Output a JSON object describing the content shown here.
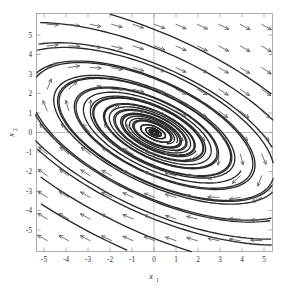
{
  "figure": {
    "kind": "phase-portrait",
    "background_color": "#ffffff",
    "frame_color": "#9a9a9a",
    "trajectory_color": "#2a2a2a",
    "arrow_color": "#585858"
  },
  "axes": {
    "x_title": "x",
    "x_subscript": "1",
    "y_title": "x",
    "y_subscript": "2",
    "x_ticks": [
      "-5",
      "-4",
      "-3",
      "-2",
      "-1",
      "0",
      "1",
      "2",
      "3",
      "4",
      "5"
    ],
    "y_ticks": [
      "5",
      "4",
      "3",
      "2",
      "1",
      "0",
      "-1",
      "-2",
      "-3",
      "-4",
      "-5"
    ],
    "x_range": [
      -5.5,
      5.5
    ],
    "y_range": [
      -5.5,
      5.5
    ]
  },
  "chart_data": {
    "type": "line",
    "title": "",
    "subtitle": "",
    "xlabel": "x1",
    "ylabel": "x2",
    "xlim": [
      -5.5,
      5.5
    ],
    "ylim": [
      -5.5,
      5.5
    ],
    "xticks": [
      -5,
      -4,
      -3,
      -2,
      -1,
      0,
      1,
      2,
      3,
      4,
      5
    ],
    "yticks": [
      -5,
      -4,
      -3,
      -2,
      -1,
      0,
      1,
      2,
      3,
      4,
      5
    ],
    "grid": false,
    "legend": "none",
    "equilibrium": {
      "x": 0,
      "y": 0,
      "classification": "stable spiral (focus)",
      "rotation": "clockwise"
    },
    "spiral_model": {
      "r0_values": [
        0.28,
        0.52,
        0.85,
        1.35,
        2.1,
        3.1,
        4.4,
        6.0,
        7.8,
        9.8,
        12.0,
        14.6
      ],
      "decay_rate": 0.072,
      "angular_rate": 1.0,
      "ellipse_axis_ratio": 0.42,
      "ellipse_tilt_degrees": -24,
      "theta_span_turns": 2.6
    },
    "series": [
      {
        "name": "trajectory-1",
        "r0": 0.28,
        "comment": "innermost tight spiral"
      },
      {
        "name": "trajectory-2",
        "r0": 0.52
      },
      {
        "name": "trajectory-3",
        "r0": 0.85
      },
      {
        "name": "trajectory-4",
        "r0": 1.35
      },
      {
        "name": "trajectory-5",
        "r0": 2.1
      },
      {
        "name": "trajectory-6",
        "r0": 3.1
      },
      {
        "name": "trajectory-7",
        "r0": 4.4
      },
      {
        "name": "trajectory-8",
        "r0": 6.0
      },
      {
        "name": "trajectory-9",
        "r0": 7.8
      },
      {
        "name": "trajectory-10",
        "r0": 9.8
      },
      {
        "name": "trajectory-11",
        "r0": 12.0
      },
      {
        "name": "trajectory-12",
        "r0": 14.6,
        "comment": "outermost arc clipped by frame"
      }
    ],
    "vector_field": {
      "arrow_grid_x": [
        -5,
        -4,
        -3,
        -2,
        -1,
        0,
        1,
        2,
        3,
        4,
        5
      ],
      "arrow_grid_y": [
        -5,
        -4,
        -3,
        -2,
        -1,
        0,
        1,
        2,
        3,
        4,
        5
      ],
      "dominant_direction_upper_half": "left",
      "dominant_direction_lower_half": "right",
      "arrow_length_px": 11
    }
  }
}
